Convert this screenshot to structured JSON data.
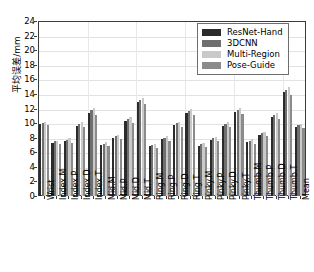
{
  "chart_data": {
    "type": "bar",
    "title": "",
    "xlabel": "",
    "ylabel": "平均误差/mm",
    "ylim": [
      0,
      24
    ],
    "ytick_step": 2,
    "yticks": [
      0,
      2,
      4,
      6,
      8,
      10,
      12,
      14,
      16,
      18,
      20,
      22,
      24
    ],
    "grid": true,
    "legend_position": "top-right",
    "categories": [
      "Wrist",
      "Index.M",
      "Index.P",
      "Index.D",
      "Index.T",
      "Mid.M",
      "Mid.P",
      "Mid.D",
      "Mid.T",
      "Ring.M",
      "Ring.P",
      "Ring.D",
      "Ring.T",
      "Pinky.M",
      "Pinky.P",
      "Pinky.D",
      "Pinky.T",
      "Thumb.M",
      "Thumb.P",
      "Thumb.D",
      "Thumb.T",
      "Mean"
    ],
    "series": [
      {
        "name": "ResNet-Hand",
        "color": "#2b2b2b",
        "values": [
          9.9,
          7.3,
          7.5,
          9.6,
          11.4,
          7.0,
          8.0,
          10.3,
          12.9,
          6.8,
          7.8,
          9.7,
          11.4,
          6.9,
          7.7,
          9.6,
          11.5,
          7.4,
          8.4,
          10.8,
          14.2,
          9.5
        ]
      },
      {
        "name": "3DCNN",
        "color": "#6f6f6f",
        "values": [
          10.0,
          7.5,
          7.7,
          9.9,
          11.8,
          7.2,
          8.2,
          10.6,
          13.2,
          7.0,
          8.0,
          10.0,
          11.7,
          7.1,
          7.9,
          9.9,
          11.8,
          7.6,
          8.6,
          11.1,
          14.6,
          9.7
        ]
      },
      {
        "name": "Multi-Region",
        "color": "#c9c9c9",
        "values": [
          10.1,
          7.6,
          7.9,
          10.1,
          12.1,
          7.4,
          8.4,
          10.8,
          13.5,
          7.2,
          8.2,
          10.2,
          12.0,
          7.3,
          8.1,
          10.1,
          12.1,
          7.8,
          8.8,
          11.4,
          15.0,
          9.9
        ]
      },
      {
        "name": "Pose-Guide",
        "color": "#8b8b8b",
        "values": [
          9.7,
          7.1,
          7.3,
          9.4,
          11.1,
          6.8,
          7.8,
          10.0,
          12.6,
          6.6,
          7.6,
          9.5,
          11.1,
          6.7,
          7.5,
          9.4,
          11.2,
          7.2,
          8.2,
          10.5,
          13.9,
          9.3
        ]
      }
    ]
  },
  "legend": {
    "items": [
      {
        "label": "ResNet-Hand"
      },
      {
        "label": "3DCNN"
      },
      {
        "label": "Multi-Region"
      },
      {
        "label": "Pose-Guide"
      }
    ]
  }
}
